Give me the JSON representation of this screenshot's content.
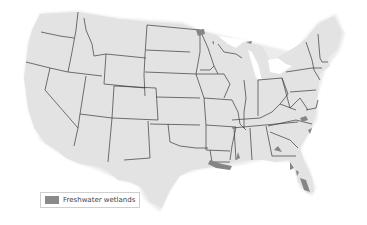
{
  "map": {
    "land_color": "#e3e3e3",
    "border_color": "#3a3a3a",
    "wetland_color": "#858585"
  },
  "legend": {
    "items": [
      {
        "label": "Freshwater wetlands",
        "color": "#858585"
      }
    ]
  }
}
